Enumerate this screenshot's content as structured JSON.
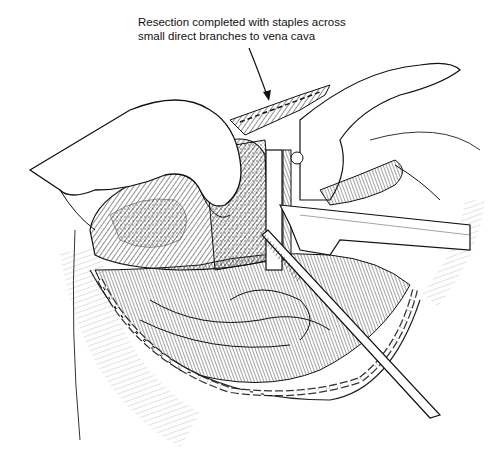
{
  "figure": {
    "caption_lines": [
      "Resection completed with staples across",
      "small direct branches to vena cava"
    ],
    "colors": {
      "ink": "#111111",
      "paper": "#ffffff"
    }
  }
}
